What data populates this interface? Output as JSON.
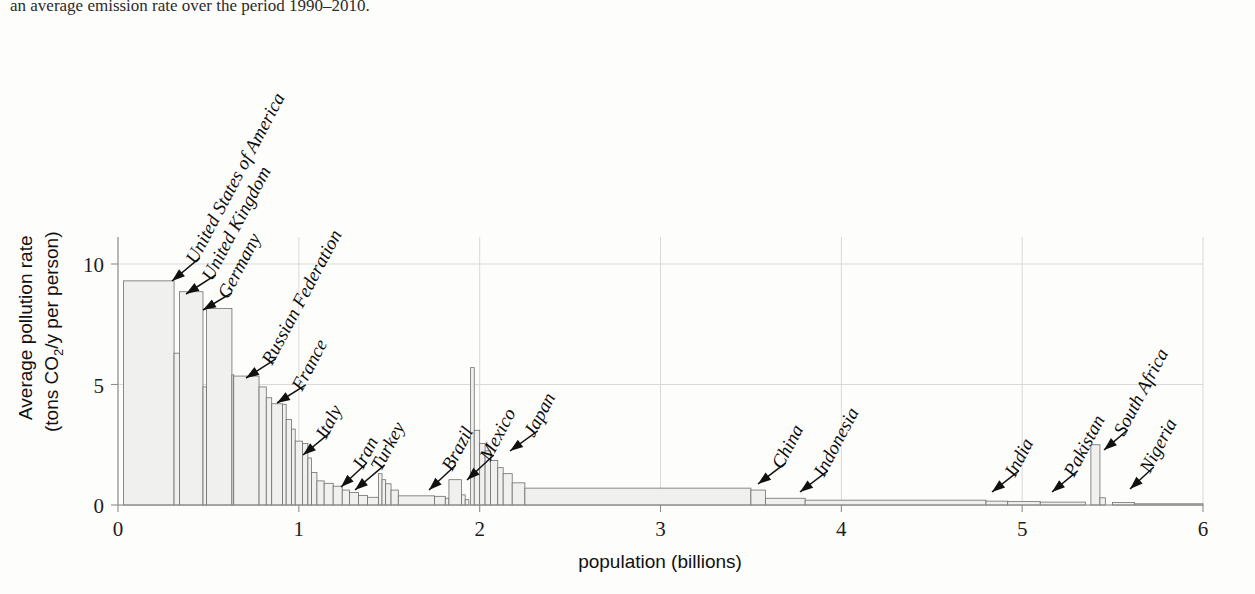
{
  "caption": {
    "text": "an average emission rate over the period 1990–2010."
  },
  "chart_data": {
    "type": "bar",
    "title": "",
    "subtitle": "",
    "xlabel": "population  (billions)",
    "ylabel": "Average pollution rate",
    "ylabel_sub": "(tons CO₂/y per person)",
    "ylabel_full": "Average pollution rate (tons CO2/y per person)",
    "xlim": [
      0,
      6
    ],
    "ylim": [
      0,
      11.6
    ],
    "xticks": [
      0,
      1,
      2,
      3,
      4,
      5,
      6
    ],
    "xticklabels": [
      "0",
      "1",
      "2",
      "3",
      "4",
      "5",
      "6"
    ],
    "yticks": [
      0,
      5,
      10
    ],
    "yticklabels": [
      "0",
      "5",
      "10"
    ],
    "grid": true,
    "legend": false,
    "legend_position": "none",
    "orientation": "variable-width-bars-sorted-descending",
    "x_unit": "billions of cumulative population",
    "y_unit": "tons CO2 per year per person",
    "note": "Marimekko style: each bar width = country population (billions), height = per-capita CO2 emission rate; bars sorted by descending rate along cumulative population axis.",
    "bars": [
      {
        "label": "",
        "x0": 0.03,
        "width": 0.28,
        "value": 9.3
      },
      {
        "label": "",
        "x0": 0.31,
        "width": 0.03,
        "value": 6.3
      },
      {
        "label": "United States of America",
        "x0": 0.34,
        "width": 0.13,
        "value": 8.85
      },
      {
        "label": "",
        "x0": 0.47,
        "width": 0.02,
        "value": 4.9
      },
      {
        "label": "United Kingdom",
        "x0": 0.49,
        "width": 0.14,
        "value": 8.15
      },
      {
        "label": "Germany",
        "x0": 0.63,
        "width": 0.01,
        "value": 5.4
      },
      {
        "label": "",
        "x0": 0.64,
        "width": 0.14,
        "value": 5.35
      },
      {
        "label": "",
        "x0": 0.78,
        "width": 0.04,
        "value": 4.9
      },
      {
        "label": "Russian Federation",
        "x0": 0.82,
        "width": 0.03,
        "value": 4.45
      },
      {
        "label": "",
        "x0": 0.85,
        "width": 0.06,
        "value": 4.2
      },
      {
        "label": "",
        "x0": 0.91,
        "width": 0.02,
        "value": 4.18
      },
      {
        "label": "France",
        "x0": 0.93,
        "width": 0.03,
        "value": 3.55
      },
      {
        "label": "",
        "x0": 0.96,
        "width": 0.02,
        "value": 3.15
      },
      {
        "label": "",
        "x0": 0.98,
        "width": 0.04,
        "value": 2.65
      },
      {
        "label": "",
        "x0": 1.02,
        "width": 0.03,
        "value": 2.55
      },
      {
        "label": "",
        "x0": 1.05,
        "width": 0.02,
        "value": 1.95
      },
      {
        "label": "Italy",
        "x0": 1.07,
        "width": 0.03,
        "value": 1.35
      },
      {
        "label": "",
        "x0": 1.1,
        "width": 0.04,
        "value": 1.0
      },
      {
        "label": "",
        "x0": 1.14,
        "width": 0.05,
        "value": 0.9
      },
      {
        "label": "",
        "x0": 1.19,
        "width": 0.05,
        "value": 0.78
      },
      {
        "label": "Iran",
        "x0": 1.24,
        "width": 0.04,
        "value": 0.62
      },
      {
        "label": "Turkey",
        "x0": 1.28,
        "width": 0.05,
        "value": 0.52
      },
      {
        "label": "",
        "x0": 1.33,
        "width": 0.05,
        "value": 0.4
      },
      {
        "label": "",
        "x0": 1.38,
        "width": 0.06,
        "value": 0.32
      },
      {
        "label": "",
        "x0": 1.44,
        "width": 0.02,
        "value": 1.3
      },
      {
        "label": "",
        "x0": 1.46,
        "width": 0.02,
        "value": 1.05
      },
      {
        "label": "",
        "x0": 1.48,
        "width": 0.03,
        "value": 0.88
      },
      {
        "label": "",
        "x0": 1.51,
        "width": 0.04,
        "value": 0.62
      },
      {
        "label": "",
        "x0": 1.55,
        "width": 0.2,
        "value": 0.38
      },
      {
        "label": "Brazil",
        "x0": 1.75,
        "width": 0.06,
        "value": 0.36
      },
      {
        "label": "",
        "x0": 1.81,
        "width": 0.02,
        "value": 0.28
      },
      {
        "label": "",
        "x0": 1.83,
        "width": 0.07,
        "value": 1.05
      },
      {
        "label": "",
        "x0": 1.9,
        "width": 0.02,
        "value": 0.42
      },
      {
        "label": "Mexico",
        "x0": 1.92,
        "width": 0.02,
        "value": 0.22
      },
      {
        "label": "",
        "x0": 1.95,
        "width": 0.02,
        "value": 5.7
      },
      {
        "label": "",
        "x0": 1.97,
        "width": 0.03,
        "value": 3.1
      },
      {
        "label": "",
        "x0": 2.0,
        "width": 0.03,
        "value": 2.55
      },
      {
        "label": "Japan",
        "x0": 2.03,
        "width": 0.03,
        "value": 2.25
      },
      {
        "label": "",
        "x0": 2.06,
        "width": 0.04,
        "value": 1.85
      },
      {
        "label": "",
        "x0": 2.1,
        "width": 0.03,
        "value": 1.55
      },
      {
        "label": "",
        "x0": 2.13,
        "width": 0.05,
        "value": 1.3
      },
      {
        "label": "",
        "x0": 2.18,
        "width": 0.07,
        "value": 0.92
      },
      {
        "label": "China",
        "x0": 2.25,
        "width": 1.25,
        "value": 0.7
      },
      {
        "label": "",
        "x0": 3.5,
        "width": 0.08,
        "value": 0.62
      },
      {
        "label": "Indonesia",
        "x0": 3.58,
        "width": 0.22,
        "value": 0.28
      },
      {
        "label": "",
        "x0": 3.8,
        "width": 1.0,
        "value": 0.2
      },
      {
        "label": "India",
        "x0": 4.8,
        "width": 0.12,
        "value": 0.16
      },
      {
        "label": "",
        "x0": 4.92,
        "width": 0.18,
        "value": 0.14
      },
      {
        "label": "Pakistan",
        "x0": 5.1,
        "width": 0.25,
        "value": 0.12
      },
      {
        "label": "South Africa",
        "x0": 5.38,
        "width": 0.05,
        "value": 2.5
      },
      {
        "label": "",
        "x0": 5.43,
        "width": 0.03,
        "value": 0.3
      },
      {
        "label": "Nigeria",
        "x0": 5.5,
        "width": 0.12,
        "value": 0.1
      },
      {
        "label": "",
        "x0": 5.62,
        "width": 0.38,
        "value": 0.05
      }
    ],
    "annotations": [
      {
        "label": "United States of America",
        "value": 9.3,
        "population_x": 0.16
      },
      {
        "label": "United Kingdom",
        "value": 8.85,
        "population_x": 0.4
      },
      {
        "label": "Germany",
        "value": 8.15,
        "population_x": 0.55
      },
      {
        "label": "Russian Federation",
        "value": 5.35,
        "population_x": 0.7
      },
      {
        "label": "France",
        "value": 4.2,
        "population_x": 0.88
      },
      {
        "label": "Italy",
        "value": 2.55,
        "population_x": 1.03
      },
      {
        "label": "Iran",
        "value": 0.62,
        "population_x": 1.25
      },
      {
        "label": "Turkey",
        "value": 0.52,
        "population_x": 1.31
      },
      {
        "label": "Brazil",
        "value": 0.36,
        "population_x": 1.78
      },
      {
        "label": "Mexico",
        "value": 1.05,
        "population_x": 1.86
      },
      {
        "label": "Japan",
        "value": 2.25,
        "population_x": 2.03
      },
      {
        "label": "China",
        "value": 0.7,
        "population_x": 3.45
      },
      {
        "label": "Indonesia",
        "value": 0.28,
        "population_x": 3.72
      },
      {
        "label": "India",
        "value": 0.16,
        "population_x": 4.82
      },
      {
        "label": "Pakistan",
        "value": 0.12,
        "population_x": 5.12
      },
      {
        "label": "South Africa",
        "value": 2.5,
        "population_x": 5.4
      },
      {
        "label": "Nigeria",
        "value": 0.1,
        "population_x": 5.53
      }
    ],
    "colors": {
      "bar_fill": "#f0f0ee",
      "bar_stroke": "#6f6f6f",
      "grid": "#d9d9d9",
      "axis": "#8d8d8d",
      "text": "#111111",
      "background": "#fdfdfc"
    }
  }
}
